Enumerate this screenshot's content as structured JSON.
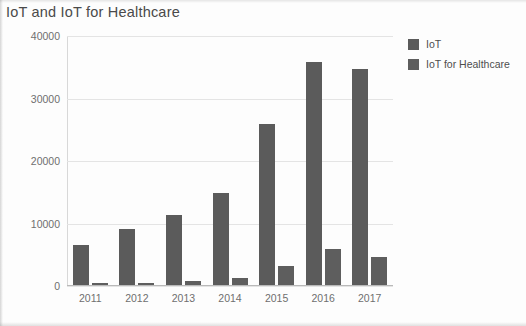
{
  "chart_data": {
    "type": "bar",
    "title": "IoT and IoT for Healthcare",
    "xlabel": "",
    "ylabel": "",
    "categories": [
      "2011",
      "2012",
      "2013",
      "2014",
      "2015",
      "2016",
      "2017"
    ],
    "series": [
      {
        "name": "IoT",
        "values": [
          6400,
          9000,
          11200,
          14800,
          25700,
          35700,
          34600
        ],
        "color": "#5b5b5b"
      },
      {
        "name": "IoT for Healthcare",
        "values": [
          300,
          400,
          700,
          1200,
          3000,
          5700,
          4500
        ],
        "color": "#5e5e5e"
      }
    ],
    "ylim": [
      0,
      40000
    ],
    "yticks": [
      0,
      10000,
      20000,
      30000,
      40000
    ],
    "ytick_labels": [
      "0",
      "10000",
      "20000",
      "30000",
      "40000"
    ],
    "grid": "horizontal",
    "legend_position": "right-top"
  },
  "legend": {
    "items": [
      {
        "label": "IoT",
        "color": "#5b5b5b"
      },
      {
        "label": "IoT for Healthcare",
        "color": "#5e5e5e"
      }
    ]
  }
}
